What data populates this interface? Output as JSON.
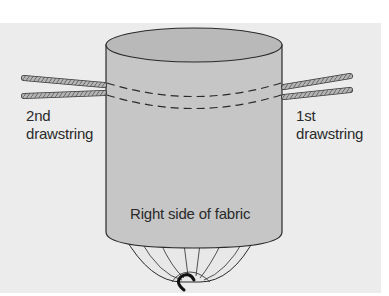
{
  "diagram": {
    "labels": {
      "second_drawstring": [
        "2nd",
        "drawstring"
      ],
      "first_drawstring": [
        "1st",
        "drawstring"
      ],
      "fabric_side": "Right side of fabric"
    },
    "colors": {
      "background_panel": "#ececec",
      "fabric_body": "#c4c4c4",
      "fabric_top": "#b8b8b8",
      "gathered_bottom": "#e4e4e4",
      "outline": "#2a2a2a",
      "rope": "#b0b0b0"
    }
  }
}
